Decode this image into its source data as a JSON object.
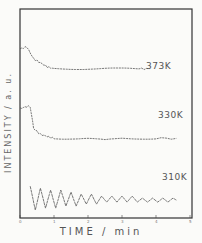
{
  "chart_data": {
    "type": "line",
    "title": "",
    "xlabel": "TIME / min",
    "ylabel": "INTENSITY / a. u.",
    "xlim": [
      0,
      5
    ],
    "x_ticks": [
      "0",
      "1",
      "2",
      "3",
      "4",
      "5"
    ],
    "y_ticks": [],
    "grid": false,
    "legend": "none (traces labeled inline)",
    "series": [
      {
        "name": "373K",
        "label_position": {
          "x_min": 3.9,
          "offset": "above trace"
        },
        "x": [
          0.0,
          0.2,
          0.4,
          0.6,
          0.8,
          1.0,
          1.5,
          2.0,
          2.5,
          3.0,
          3.5,
          3.8
        ],
        "values": [
          0.85,
          0.86,
          0.8,
          0.78,
          0.76,
          0.75,
          0.75,
          0.75,
          0.75,
          0.75,
          0.75,
          0.75
        ]
      },
      {
        "name": "330K",
        "x": [
          0.0,
          0.2,
          0.3,
          0.4,
          0.6,
          0.8,
          1.0,
          1.5,
          2.0,
          2.5,
          3.0,
          3.5,
          4.0,
          4.6
        ],
        "values": [
          0.55,
          0.56,
          0.56,
          0.45,
          0.42,
          0.41,
          0.4,
          0.4,
          0.4,
          0.39,
          0.4,
          0.4,
          0.4,
          0.4
        ]
      },
      {
        "name": "310K",
        "description": "damped oscillation, ~14 cycles between 0.3 and 4.6 min",
        "x": [
          0.3,
          0.45,
          0.6,
          0.75,
          0.9,
          1.05,
          1.2,
          1.35,
          1.5,
          1.65,
          1.8,
          1.95,
          2.1,
          2.25,
          2.4,
          2.55,
          2.7,
          2.85,
          3.0,
          3.15,
          3.3,
          3.45,
          3.6,
          3.75,
          3.9,
          4.05,
          4.2,
          4.35,
          4.5,
          4.6
        ],
        "values": [
          0.16,
          0.04,
          0.15,
          0.05,
          0.14,
          0.05,
          0.14,
          0.06,
          0.13,
          0.06,
          0.12,
          0.07,
          0.12,
          0.07,
          0.11,
          0.08,
          0.11,
          0.08,
          0.11,
          0.08,
          0.11,
          0.08,
          0.1,
          0.08,
          0.1,
          0.08,
          0.1,
          0.08,
          0.1,
          0.09
        ]
      }
    ]
  },
  "labels": {
    "t373": "373K",
    "t330": "330K",
    "t310": "310K",
    "xlabel": "TIME / min",
    "ylabel": "INTENSITY / a. u."
  },
  "ticks": [
    "0",
    "1",
    "2",
    "3",
    "4",
    "5"
  ]
}
